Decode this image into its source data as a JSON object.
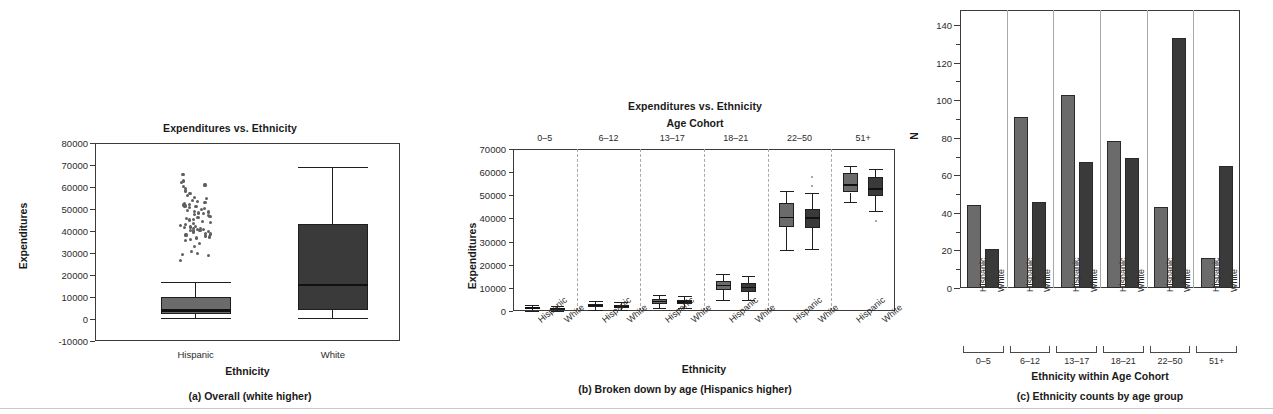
{
  "figure": {
    "panels": [
      "a",
      "b",
      "c"
    ]
  },
  "panel_a": {
    "title": "Expenditures vs. Ethnicity",
    "ylabel": "Expenditures",
    "xlabel": "Ethnicity",
    "caption": "(a) Overall (white higher)",
    "yticks": [
      "80000",
      "70000",
      "60000",
      "50000",
      "40000",
      "30000",
      "20000",
      "10000",
      "0",
      "-10000"
    ],
    "xticks": [
      "Hispanic",
      "White"
    ]
  },
  "panel_b": {
    "title": "Expenditures vs. Ethnicity",
    "subtitle": "Age Cohort",
    "ylabel": "Expenditures",
    "xlabel": "Ethnicity",
    "caption": "(b) Broken down by age (Hispanics higher)",
    "yticks": [
      "70000",
      "60000",
      "50000",
      "40000",
      "30000",
      "20000",
      "10000",
      "0"
    ],
    "cohorts": [
      "0–5",
      "6–12",
      "13–17",
      "18–21",
      "22–50",
      "51+"
    ],
    "xticks": [
      "Hispanic",
      "White",
      "Hispanic",
      "White",
      "Hispanic",
      "White",
      "Hispanic",
      "White",
      "Hispanic",
      "White",
      "Hispanic",
      "White"
    ]
  },
  "panel_c": {
    "ylabel": "N",
    "xlabel": "Ethnicity within Age Cohort",
    "caption": "(c) Ethnicity counts by age group",
    "yticks": [
      "140",
      "120",
      "100",
      "80",
      "60",
      "40",
      "20",
      "0"
    ],
    "cohorts": [
      "0–5",
      "6–12",
      "13–17",
      "18–21",
      "22–50",
      "51+"
    ],
    "xticks": [
      "Hispanic",
      "White",
      "Hispanic",
      "White",
      "Hispanic",
      "White",
      "Hispanic",
      "White",
      "Hispanic",
      "White",
      "Hispanic",
      "White"
    ]
  },
  "colors": {
    "hispanic_fill": "#6b6b6b",
    "white_fill": "#3a3a3a",
    "box_stroke": "#1f1f1f",
    "axis": "#3b3b3b",
    "gridline": "#a9a9a9",
    "scatter": "#5f5f5f"
  },
  "chart_data": [
    {
      "id": "panel_a",
      "type": "box",
      "title": "Expenditures vs. Ethnicity",
      "xlabel": "Ethnicity",
      "ylabel": "Expenditures",
      "ylim": [
        -10000,
        80000
      ],
      "ytick_step": 10000,
      "grid": false,
      "legend": "none",
      "categories": [
        "Hispanic",
        "White"
      ],
      "boxes": [
        {
          "category": "Hispanic",
          "whisker_low": 300,
          "q1": 2200,
          "median": 4000,
          "q3": 10200,
          "whisker_high": 17000,
          "fill": "#6b6b6b",
          "outliers": [
            26700,
            28800,
            29200,
            29700,
            30600,
            33000,
            34500,
            35500,
            36000,
            36800,
            37300,
            37700,
            38200,
            38600,
            39000,
            39400,
            39800,
            40000,
            40200,
            40400,
            40600,
            40800,
            41000,
            41200,
            41500,
            41800,
            42200,
            42600,
            43000,
            43500,
            44000,
            44500,
            45000,
            45400,
            45800,
            46200,
            46600,
            47000,
            47400,
            47800,
            48200,
            48600,
            49000,
            49400,
            49800,
            50200,
            50600,
            51000,
            51400,
            51800,
            52200,
            52600,
            53000,
            53500,
            54000,
            54600,
            55200,
            56000,
            57000,
            58200,
            59300,
            60300,
            60900,
            62000,
            62700,
            65600
          ]
        },
        {
          "category": "White",
          "whisker_low": 400,
          "q1": 4200,
          "median": 15600,
          "q3": 43200,
          "whisker_high": 68900,
          "fill": "#3a3a3a",
          "outliers": []
        }
      ]
    },
    {
      "id": "panel_b",
      "type": "box",
      "title": "Expenditures vs. Ethnicity",
      "subtitle": "Age Cohort",
      "xlabel": "Ethnicity",
      "ylabel": "Expenditures",
      "ylim": [
        0,
        70000
      ],
      "ytick_step": 10000,
      "grid": false,
      "legend": "none",
      "group_labels": [
        "0–5",
        "6–12",
        "13–17",
        "18–21",
        "22–50",
        "51+"
      ],
      "boxes": [
        {
          "group": "0–5",
          "category": "Hispanic",
          "whisker_low": 200,
          "q1": 700,
          "median": 1200,
          "q3": 1800,
          "whisker_high": 2600,
          "fill": "#6b6b6b",
          "outliers": []
        },
        {
          "group": "0–5",
          "category": "White",
          "whisker_low": 200,
          "q1": 600,
          "median": 1000,
          "q3": 1500,
          "whisker_high": 2000,
          "fill": "#3a3a3a",
          "outliers": []
        },
        {
          "group": "6–12",
          "category": "Hispanic",
          "whisker_low": 500,
          "q1": 1600,
          "median": 2300,
          "q3": 3000,
          "whisker_high": 4300,
          "fill": "#6b6b6b",
          "outliers": []
        },
        {
          "group": "6–12",
          "category": "White",
          "whisker_low": 400,
          "q1": 1300,
          "median": 1900,
          "q3": 2600,
          "whisker_high": 3800,
          "fill": "#3a3a3a",
          "outliers": []
        },
        {
          "group": "13–17",
          "category": "Hispanic",
          "whisker_low": 1400,
          "q1": 3100,
          "median": 4100,
          "q3": 5000,
          "whisker_high": 6700,
          "fill": "#6b6b6b",
          "outliers": []
        },
        {
          "group": "13–17",
          "category": "White",
          "whisker_low": 1100,
          "q1": 2900,
          "median": 3800,
          "q3": 4700,
          "whisker_high": 6300,
          "fill": "#3a3a3a",
          "outliers": []
        },
        {
          "group": "18–21",
          "category": "Hispanic",
          "whisker_low": 4900,
          "q1": 9000,
          "median": 11000,
          "q3": 13000,
          "whisker_high": 16200,
          "fill": "#6b6b6b",
          "outliers": []
        },
        {
          "group": "18–21",
          "category": "White",
          "whisker_low": 4600,
          "q1": 8300,
          "median": 10200,
          "q3": 12000,
          "whisker_high": 15000,
          "fill": "#3a3a3a",
          "outliers": []
        },
        {
          "group": "22–50",
          "category": "Hispanic",
          "whisker_low": 26200,
          "q1": 36500,
          "median": 40400,
          "q3": 46600,
          "whisker_high": 51900,
          "fill": "#6b6b6b",
          "outliers": []
        },
        {
          "group": "22–50",
          "category": "White",
          "whisker_low": 26800,
          "q1": 35700,
          "median": 40100,
          "q3": 44000,
          "whisker_high": 50800,
          "fill": "#3a3a3a",
          "outliers": [
            54100,
            58000
          ]
        },
        {
          "group": "51+",
          "category": "Hispanic",
          "whisker_low": 47200,
          "q1": 51200,
          "median": 54500,
          "q3": 59700,
          "whisker_high": 62700,
          "fill": "#6b6b6b",
          "outliers": []
        },
        {
          "group": "51+",
          "category": "White",
          "whisker_low": 43100,
          "q1": 49600,
          "median": 52700,
          "q3": 57800,
          "whisker_high": 61200,
          "fill": "#3a3a3a",
          "outliers": [
            38900
          ]
        }
      ]
    },
    {
      "id": "panel_c",
      "type": "bar",
      "xlabel": "Ethnicity within Age Cohort",
      "ylabel": "N",
      "ylim": [
        0,
        148
      ],
      "ytick_step": 20,
      "grid": false,
      "legend": "none",
      "group_labels": [
        "0–5",
        "6–12",
        "13–17",
        "18–21",
        "22–50",
        "51+"
      ],
      "categories": [
        "Hispanic",
        "White"
      ],
      "series": [
        {
          "name": "Hispanic",
          "values": [
            44,
            91,
            103,
            78,
            43,
            16
          ],
          "fill": "#6b6b6b"
        },
        {
          "name": "White",
          "values": [
            21,
            46,
            67,
            69,
            133,
            65
          ],
          "fill": "#3a3a3a"
        }
      ]
    }
  ]
}
